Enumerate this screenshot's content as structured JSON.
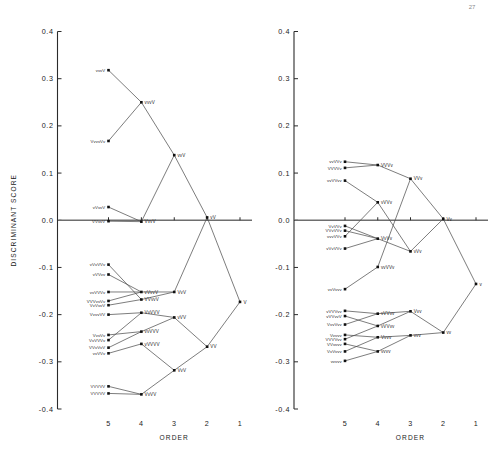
{
  "page": {
    "corner_mark": "27"
  },
  "axes": {
    "y_title": "DISCRIMINANT  SCORE",
    "x_title": "ORDER",
    "y_ticks": [
      "0.4",
      "0.3",
      "0.2",
      "0.1",
      "0.0",
      "-0.1",
      "-0.2",
      "-0.3",
      "-0.4"
    ],
    "y_values": [
      0.4,
      0.3,
      0.2,
      0.1,
      0.0,
      -0.1,
      -0.2,
      -0.3,
      -0.4
    ],
    "x_ticks": [
      "5",
      "4",
      "3",
      "2",
      "1"
    ],
    "x_values": [
      5,
      4,
      3,
      2,
      1
    ],
    "ylim": [
      -0.4,
      0.4
    ],
    "xlim": [
      5,
      1
    ]
  },
  "colors": {
    "axis": "#2b2b2b",
    "branch": "#4a4a4a",
    "zero_line": "#6e6e6e",
    "node": "#101010",
    "background": "#ffffff"
  },
  "chart_data": {
    "type": "scatter",
    "title": "",
    "xlabel": "ORDER",
    "ylabel": "DISCRIMINANT  SCORE",
    "xlim": [
      5,
      1
    ],
    "ylim": [
      -0.4,
      0.4
    ],
    "grid": false,
    "legend": "none",
    "note": "Two side-by-side dendrogram / agglomeration trees: nodes plotted at (ORDER, DISCRIMINANT SCORE); branches join clusters moving right from order 5 to order 1.",
    "panels": [
      {
        "name": "left-panel",
        "nodes": [
          {
            "id": "L5a",
            "order": 5,
            "score": 0.318,
            "label": "vvvV"
          },
          {
            "id": "L5b",
            "order": 5,
            "score": 0.168,
            "label": "VvvvVv"
          },
          {
            "id": "L5c",
            "order": 5,
            "score": 0.028,
            "label": "vVvvV"
          },
          {
            "id": "L5d",
            "order": 5,
            "score": -0.002,
            "label": "VVvvV"
          },
          {
            "id": "L5e",
            "order": 5,
            "score": -0.094,
            "label": "vVvVVv"
          },
          {
            "id": "L5f",
            "order": 5,
            "score": -0.115,
            "label": "vVVvv"
          },
          {
            "id": "L5g",
            "order": 5,
            "score": -0.152,
            "label": "vvVVVv"
          },
          {
            "id": "L5h",
            "order": 5,
            "score": -0.171,
            "label": "VVVvvVv"
          },
          {
            "id": "L5i",
            "order": 5,
            "score": -0.18,
            "label": "VvVvvV"
          },
          {
            "id": "L5j",
            "order": 5,
            "score": -0.2,
            "label": "VvvvVV"
          },
          {
            "id": "L5k",
            "order": 5,
            "score": -0.243,
            "label": "VvvVv"
          },
          {
            "id": "L5l",
            "order": 5,
            "score": -0.254,
            "label": "VvVVVv"
          },
          {
            "id": "L5m",
            "order": 5,
            "score": -0.27,
            "label": "VVvVvV"
          },
          {
            "id": "L5n",
            "order": 5,
            "score": -0.282,
            "label": "vvVVv"
          },
          {
            "id": "L5o",
            "order": 5,
            "score": -0.352,
            "label": "VVVVV"
          },
          {
            "id": "L5p",
            "order": 5,
            "score": -0.367,
            "label": "VVVVV"
          },
          {
            "id": "L4a",
            "order": 4,
            "score": 0.25,
            "label": "vvvV"
          },
          {
            "id": "L4b",
            "order": 4,
            "score": -0.003,
            "label": "VvvV"
          },
          {
            "id": "L4c",
            "order": 4,
            "score": -0.152,
            "label": "vVvvV"
          },
          {
            "id": "L4d",
            "order": 4,
            "score": -0.168,
            "label": "VVvvV"
          },
          {
            "id": "L4e",
            "order": 4,
            "score": -0.196,
            "label": "VvVVV"
          },
          {
            "id": "L4f",
            "order": 4,
            "score": -0.236,
            "label": "vvVVV"
          },
          {
            "id": "L4g",
            "order": 4,
            "score": -0.262,
            "label": "vVVVV"
          },
          {
            "id": "L4h",
            "order": 4,
            "score": -0.369,
            "label": "VvVV"
          },
          {
            "id": "L3a",
            "order": 3,
            "score": 0.138,
            "label": "vvV"
          },
          {
            "id": "L3b",
            "order": 3,
            "score": -0.152,
            "label": "VvV"
          },
          {
            "id": "L3c",
            "order": 3,
            "score": -0.206,
            "label": "vVV"
          },
          {
            "id": "L3d",
            "order": 3,
            "score": -0.318,
            "label": "VvV"
          },
          {
            "id": "L2a",
            "order": 2,
            "score": 0.006,
            "label": "vV"
          },
          {
            "id": "L2b",
            "order": 2,
            "score": -0.268,
            "label": "VV"
          },
          {
            "id": "L1a",
            "order": 1,
            "score": -0.173,
            "label": "V"
          }
        ],
        "edges": [
          [
            "L5a",
            "L4a"
          ],
          [
            "L5b",
            "L4a"
          ],
          [
            "L5c",
            "L4b"
          ],
          [
            "L5d",
            "L4b"
          ],
          [
            "L4a",
            "L3a"
          ],
          [
            "L4b",
            "L3a"
          ],
          [
            "L5e",
            "L4d"
          ],
          [
            "L5f",
            "L4c"
          ],
          [
            "L5g",
            "L4c"
          ],
          [
            "L5h",
            "L4c"
          ],
          [
            "L5i",
            "L4d"
          ],
          [
            "L5j",
            "L4e"
          ],
          [
            "L4c",
            "L3b"
          ],
          [
            "L4d",
            "L3b"
          ],
          [
            "L5k",
            "L4f"
          ],
          [
            "L5l",
            "L4e"
          ],
          [
            "L5m",
            "L4f"
          ],
          [
            "L5n",
            "L4g"
          ],
          [
            "L4e",
            "L3c"
          ],
          [
            "L4f",
            "L3c"
          ],
          [
            "L5o",
            "L4h"
          ],
          [
            "L5p",
            "L4h"
          ],
          [
            "L4g",
            "L3d"
          ],
          [
            "L4h",
            "L3d"
          ],
          [
            "L3a",
            "L2a"
          ],
          [
            "L3b",
            "L2a"
          ],
          [
            "L3c",
            "L2b"
          ],
          [
            "L3d",
            "L2b"
          ],
          [
            "L2a",
            "L1a"
          ],
          [
            "L2b",
            "L1a"
          ]
        ]
      },
      {
        "name": "right-panel",
        "nodes": [
          {
            "id": "R5a",
            "order": 5,
            "score": 0.124,
            "label": "vvVVv"
          },
          {
            "id": "R5b",
            "order": 5,
            "score": 0.111,
            "label": "VVVVv"
          },
          {
            "id": "R5c",
            "order": 5,
            "score": 0.084,
            "label": "vvVVvv"
          },
          {
            "id": "R5d",
            "order": 5,
            "score": -0.012,
            "label": "VvVVv"
          },
          {
            "id": "R5e",
            "order": 5,
            "score": -0.022,
            "label": "VVvVVv"
          },
          {
            "id": "R5f",
            "order": 5,
            "score": -0.034,
            "label": "vvvVVv"
          },
          {
            "id": "R5g",
            "order": 5,
            "score": -0.06,
            "label": "vVvVVv"
          },
          {
            "id": "R5h",
            "order": 5,
            "score": -0.146,
            "label": "vvVvvv"
          },
          {
            "id": "R5i",
            "order": 5,
            "score": -0.192,
            "label": "vVVVvv"
          },
          {
            "id": "R5j",
            "order": 5,
            "score": -0.203,
            "label": "vVVvvV"
          },
          {
            "id": "R5k",
            "order": 5,
            "score": -0.221,
            "label": "VvvVvv"
          },
          {
            "id": "R5l",
            "order": 5,
            "score": -0.243,
            "label": "Vvvvv"
          },
          {
            "id": "R5m",
            "order": 5,
            "score": -0.252,
            "label": "VVVVvv"
          },
          {
            "id": "R5n",
            "order": 5,
            "score": -0.262,
            "label": "VVvvvv"
          },
          {
            "id": "R5o",
            "order": 5,
            "score": -0.278,
            "label": "VvVvvv"
          },
          {
            "id": "R5p",
            "order": 5,
            "score": -0.298,
            "label": "vvvvv"
          },
          {
            "id": "R4a",
            "order": 4,
            "score": 0.117,
            "label": "VVVv"
          },
          {
            "id": "R4b",
            "order": 4,
            "score": 0.038,
            "label": "vVVv"
          },
          {
            "id": "R4c",
            "order": 4,
            "score": -0.039,
            "label": "VvVv"
          },
          {
            "id": "R4d",
            "order": 4,
            "score": -0.099,
            "label": "vvVVv"
          },
          {
            "id": "R4e",
            "order": 4,
            "score": -0.198,
            "label": "vVVvv"
          },
          {
            "id": "R4f",
            "order": 4,
            "score": -0.224,
            "label": "vVVvv"
          },
          {
            "id": "R4g",
            "order": 4,
            "score": -0.248,
            "label": "Vvvv"
          },
          {
            "id": "R4h",
            "order": 4,
            "score": -0.278,
            "label": "vvvv"
          },
          {
            "id": "R3a",
            "order": 3,
            "score": 0.088,
            "label": "VVv"
          },
          {
            "id": "R3b",
            "order": 3,
            "score": -0.066,
            "label": "vVv"
          },
          {
            "id": "R3c",
            "order": 3,
            "score": -0.193,
            "label": "Vvv"
          },
          {
            "id": "R3d",
            "order": 3,
            "score": -0.244,
            "label": "vvv"
          },
          {
            "id": "R2a",
            "order": 2,
            "score": 0.003,
            "label": "Vv"
          },
          {
            "id": "R2b",
            "order": 2,
            "score": -0.238,
            "label": "vv"
          },
          {
            "id": "R1a",
            "order": 1,
            "score": -0.135,
            "label": "v"
          }
        ],
        "edges": [
          [
            "R5a",
            "R4a"
          ],
          [
            "R5b",
            "R4a"
          ],
          [
            "R5c",
            "R4b"
          ],
          [
            "R5d",
            "R4c"
          ],
          [
            "R5e",
            "R4c"
          ],
          [
            "R5f",
            "R4b"
          ],
          [
            "R5g",
            "R4c"
          ],
          [
            "R4a",
            "R3a"
          ],
          [
            "R4b",
            "R3b"
          ],
          [
            "R4c",
            "R3b"
          ],
          [
            "R4d",
            "R3a"
          ],
          [
            "R5h",
            "R4d"
          ],
          [
            "R5i",
            "R4e"
          ],
          [
            "R5j",
            "R4f"
          ],
          [
            "R5k",
            "R4e"
          ],
          [
            "R5l",
            "R4g"
          ],
          [
            "R5m",
            "R4f"
          ],
          [
            "R5n",
            "R4h"
          ],
          [
            "R5o",
            "R4g"
          ],
          [
            "R5p",
            "R4h"
          ],
          [
            "R4e",
            "R3c"
          ],
          [
            "R4f",
            "R3c"
          ],
          [
            "R4g",
            "R3d"
          ],
          [
            "R4h",
            "R3d"
          ],
          [
            "R3a",
            "R2a"
          ],
          [
            "R3b",
            "R2a"
          ],
          [
            "R3c",
            "R2b"
          ],
          [
            "R3d",
            "R2b"
          ],
          [
            "R2a",
            "R1a"
          ],
          [
            "R2b",
            "R1a"
          ]
        ]
      }
    ]
  }
}
